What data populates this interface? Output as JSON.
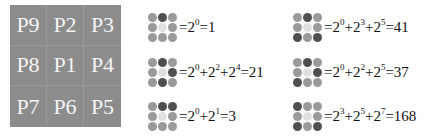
{
  "grid": {
    "cells": [
      "P9",
      "P2",
      "P3",
      "P8",
      "P1",
      "P4",
      "P7",
      "P6",
      "P5"
    ],
    "cell_color": "#8c8c8c",
    "text_color": "#f4f4f4"
  },
  "examples": [
    {
      "dark": [
        "P2"
      ],
      "terms": [
        {
          "base": "2",
          "exp": "0"
        }
      ],
      "result": "1"
    },
    {
      "dark": [
        "P2",
        "P4",
        "P6"
      ],
      "terms": [
        {
          "base": "2",
          "exp": "0"
        },
        {
          "base": "2",
          "exp": "2"
        },
        {
          "base": "2",
          "exp": "4"
        }
      ],
      "result": "21"
    },
    {
      "dark": [
        "P2",
        "P3"
      ],
      "terms": [
        {
          "base": "2",
          "exp": "0"
        },
        {
          "base": "2",
          "exp": "1"
        }
      ],
      "result": "3"
    },
    {
      "dark": [
        "P2",
        "P5",
        "P7"
      ],
      "terms": [
        {
          "base": "2",
          "exp": "0"
        },
        {
          "base": "2",
          "exp": "3"
        },
        {
          "base": "2",
          "exp": "5"
        }
      ],
      "result": "41"
    },
    {
      "dark": [
        "P2",
        "P4",
        "P7"
      ],
      "terms": [
        {
          "base": "2",
          "exp": "0"
        },
        {
          "base": "2",
          "exp": "2"
        },
        {
          "base": "2",
          "exp": "5"
        }
      ],
      "result": "37"
    },
    {
      "dark": [
        "P9",
        "P5",
        "P7"
      ],
      "terms": [
        {
          "base": "2",
          "exp": "3"
        },
        {
          "base": "2",
          "exp": "5"
        },
        {
          "base": "2",
          "exp": "7"
        }
      ],
      "result": "168"
    }
  ],
  "colors": {
    "dark_dot": "#4f4f4f",
    "light_dot": "#9a9a9a",
    "center_dot": "#e0e0e0"
  }
}
